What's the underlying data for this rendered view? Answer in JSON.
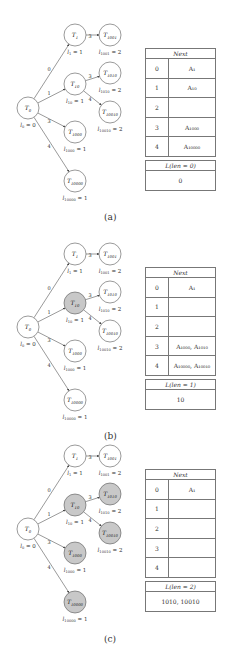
{
  "colors": {
    "visited_fill": "#c8c8c8",
    "node_fill": "#ffffff",
    "stroke": "#555555"
  },
  "panels": [
    {
      "caption": "(a)",
      "gray_nodes": [],
      "nodes": {
        "T0": {
          "label": "T",
          "sub": "0",
          "level": "l",
          "level_sub": "0",
          "level_val": " = 0"
        },
        "T1": {
          "label": "T",
          "sub": "1",
          "level": "l",
          "level_sub": "1",
          "level_val": " = 1"
        },
        "T10": {
          "label": "T",
          "sub": "10",
          "level": "l",
          "level_sub": "10",
          "level_val": " = 1"
        },
        "T1000": {
          "label": "T",
          "sub": "1000",
          "level": "l",
          "level_sub": "1000",
          "level_val": " = 1"
        },
        "T10000": {
          "label": "T",
          "sub": "10000",
          "level": "l",
          "level_sub": "10000",
          "level_val": " = 1"
        },
        "T1001": {
          "label": "T",
          "sub": "1001",
          "level": "l",
          "level_sub": "1001",
          "level_val": " = 2"
        },
        "T1010": {
          "label": "T",
          "sub": "1010",
          "level": "l",
          "level_sub": "1010",
          "level_val": " = 2"
        },
        "T10010": {
          "label": "T",
          "sub": "10010",
          "level": "l",
          "level_sub": "10010",
          "level_val": " = 2"
        }
      },
      "edges": [
        {
          "from": "T0",
          "to": "T1",
          "label": "0"
        },
        {
          "from": "T0",
          "to": "T10",
          "label": "1"
        },
        {
          "from": "T0",
          "to": "T1000",
          "label": "3"
        },
        {
          "from": "T0",
          "to": "T10000",
          "label": "4"
        },
        {
          "from": "T1",
          "to": "T1001",
          "label": "3"
        },
        {
          "from": "T10",
          "to": "T1010",
          "label": "3"
        },
        {
          "from": "T10",
          "to": "T10010",
          "label": "4"
        }
      ],
      "next_table": {
        "title": "Next",
        "rows": [
          {
            "index": "0",
            "value": "A₁"
          },
          {
            "index": "1",
            "value": "A₁₀"
          },
          {
            "index": "2",
            "value": ""
          },
          {
            "index": "3",
            "value": "A₁₀₀₀"
          },
          {
            "index": "4",
            "value": "A₁₀₀₀₀"
          }
        ]
      },
      "l_table": {
        "title": "L(len = 0)",
        "value": "0"
      }
    },
    {
      "caption": "(b)",
      "gray_nodes": [
        "T10"
      ],
      "next_table": {
        "title": "Next",
        "rows": [
          {
            "index": "0",
            "value": "A₁"
          },
          {
            "index": "1",
            "value": ""
          },
          {
            "index": "2",
            "value": ""
          },
          {
            "index": "3",
            "value": "A₁₀₀₀, A₁₀₁₀"
          },
          {
            "index": "4",
            "value": "A₁₀₀₀₀, A₁₀₀₁₀"
          }
        ]
      },
      "l_table": {
        "title": "L(len = 1)",
        "value": "10"
      }
    },
    {
      "caption": "(c)",
      "gray_nodes": [
        "T10",
        "T1000",
        "T10000",
        "T1010",
        "T10010"
      ],
      "next_table": {
        "title": "Next",
        "rows": [
          {
            "index": "0",
            "value": "A₁"
          },
          {
            "index": "1",
            "value": ""
          },
          {
            "index": "2",
            "value": ""
          },
          {
            "index": "3",
            "value": ""
          },
          {
            "index": "4",
            "value": ""
          }
        ]
      },
      "l_table": {
        "title": "L(len = 2)",
        "value": "1010, 10010"
      }
    }
  ]
}
